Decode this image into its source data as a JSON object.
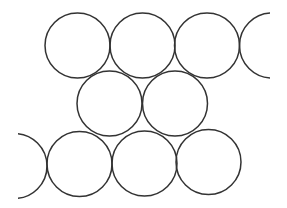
{
  "diagram": {
    "stroke_color": "#333333",
    "background_color": "#ffffff",
    "rows": [
      {
        "name": "top-row",
        "full_circles": 3,
        "partial_circles": 1
      },
      {
        "name": "middle-row",
        "full_circles": 2,
        "partial_circles": 0
      },
      {
        "name": "bottom-row",
        "full_circles": 3,
        "partial_circles": 1
      }
    ]
  }
}
